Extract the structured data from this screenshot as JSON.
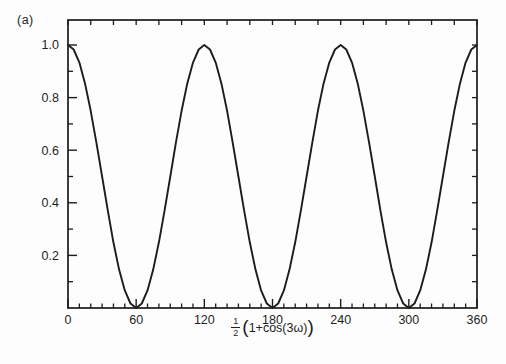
{
  "figure": {
    "panel_label": "(a)",
    "background_color": "#fdfdfd",
    "line_color": "#1c1c1c",
    "text_color": "#1e1e1e"
  },
  "chart_data": {
    "type": "line",
    "title": "",
    "xlabel_fraction_numerator": "1",
    "xlabel_fraction_denominator": "2",
    "xlabel_open_paren": "(",
    "xlabel_expression": "1+cos(3ω)",
    "xlabel_close_paren": ")",
    "xlim": [
      0,
      360
    ],
    "ylim": [
      0,
      1.095
    ],
    "grid": false,
    "legend": "none",
    "x_major_ticks": [
      0,
      60,
      120,
      180,
      240,
      300,
      360
    ],
    "x_tick_labels": [
      "0",
      "60",
      "120",
      "180",
      "240",
      "300",
      "360"
    ],
    "x_minor_step": 10,
    "top_tick_step": 20,
    "y_major_ticks": [
      0.2,
      0.4,
      0.6,
      0.8,
      1.0
    ],
    "y_tick_labels": [
      "0.2",
      "0.4",
      "0.6",
      "0.8",
      "1.0"
    ],
    "y_minor_step": 0.1,
    "right_tick_step": 0.1,
    "series": [
      {
        "name": "0.5*(1+cos(3ω))",
        "x": [
          0,
          5,
          10,
          15,
          20,
          25,
          30,
          35,
          40,
          45,
          50,
          55,
          60,
          65,
          70,
          75,
          80,
          85,
          90,
          95,
          100,
          105,
          110,
          115,
          120,
          125,
          130,
          135,
          140,
          145,
          150,
          155,
          160,
          165,
          170,
          175,
          180,
          185,
          190,
          195,
          200,
          205,
          210,
          215,
          220,
          225,
          230,
          235,
          240,
          245,
          250,
          255,
          260,
          265,
          270,
          275,
          280,
          285,
          290,
          295,
          300,
          305,
          310,
          315,
          320,
          325,
          330,
          335,
          340,
          345,
          350,
          355,
          360
        ],
        "y": [
          1,
          0.983,
          0.933,
          0.854,
          0.75,
          0.629,
          0.5,
          0.371,
          0.25,
          0.146,
          0.067,
          0.017,
          0,
          0.017,
          0.067,
          0.146,
          0.25,
          0.371,
          0.5,
          0.629,
          0.75,
          0.854,
          0.933,
          0.983,
          1,
          0.983,
          0.933,
          0.854,
          0.75,
          0.629,
          0.5,
          0.371,
          0.25,
          0.146,
          0.067,
          0.017,
          0,
          0.017,
          0.067,
          0.146,
          0.25,
          0.371,
          0.5,
          0.629,
          0.75,
          0.854,
          0.933,
          0.983,
          1,
          0.983,
          0.933,
          0.854,
          0.75,
          0.629,
          0.5,
          0.371,
          0.25,
          0.146,
          0.067,
          0.017,
          0,
          0.017,
          0.067,
          0.146,
          0.25,
          0.371,
          0.5,
          0.629,
          0.75,
          0.854,
          0.933,
          0.983,
          1
        ]
      }
    ]
  }
}
